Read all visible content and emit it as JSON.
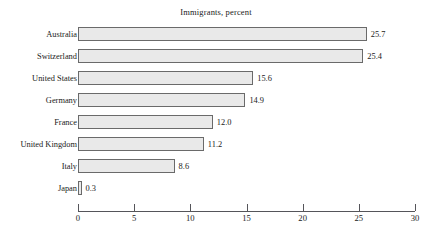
{
  "chart_data": {
    "type": "bar",
    "orientation": "horizontal",
    "title": "Immigrants, percent",
    "xlabel": "",
    "ylabel": "",
    "categories": [
      "Australia",
      "Switzerland",
      "United States",
      "Germany",
      "France",
      "United Kingdom",
      "Italy",
      "Japan"
    ],
    "values": [
      25.7,
      25.4,
      15.6,
      14.9,
      12.0,
      11.2,
      8.6,
      0.3
    ],
    "value_labels": [
      "25.7",
      "25.4",
      "15.6",
      "14.9",
      "12.0",
      "11.2",
      "8.6",
      "0.3"
    ],
    "xlim": [
      0,
      30
    ],
    "xticks": [
      0,
      5,
      10,
      15,
      20,
      25,
      30
    ],
    "xtick_labels": [
      "0",
      "5",
      "10",
      "15",
      "20",
      "25",
      "30"
    ],
    "grid": false,
    "legend": null,
    "bar_fill_color": "#e9e9e9",
    "bar_border_color": "#6a6a6a",
    "axis_color": "#55555a",
    "background_color": "#ffffff",
    "text_color": "#1a1a1a"
  }
}
